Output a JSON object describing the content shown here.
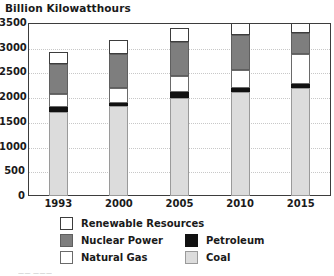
{
  "chart_data": {
    "type": "bar",
    "subtype": "stacked-vertical",
    "title": "Billion Kilowatthours",
    "xlabel": "",
    "ylabel": "Billion Kilowatthours",
    "ylim": [
      0,
      3500
    ],
    "ytick_step": 500,
    "yticks": [
      "0",
      "500",
      "1000",
      "1500",
      "2000",
      "2500",
      "3000",
      "3500"
    ],
    "grid": true,
    "grid_axis": "y",
    "legend_position": "bottom",
    "categories": [
      "1993",
      "2000",
      "2005",
      "2010",
      "2015"
    ],
    "series": [
      {
        "name": "Coal",
        "key": "coal",
        "color": "#dcdcdc",
        "values": [
          1700,
          1830,
          1990,
          2100,
          2180
        ]
      },
      {
        "name": "Petroleum",
        "key": "petroleum",
        "color": "#111111",
        "values": [
          100,
          60,
          110,
          80,
          80
        ]
      },
      {
        "name": "Natural Gas",
        "key": "natural_gas",
        "color": "#ffffff",
        "values": [
          260,
          290,
          330,
          370,
          620
        ]
      },
      {
        "name": "Nuclear Power",
        "key": "nuclear",
        "color": "#7e7e7e",
        "values": [
          610,
          700,
          680,
          700,
          420
        ]
      },
      {
        "name": "Renewable Resources",
        "key": "renewable",
        "color": "#ffffff",
        "values": [
          250,
          280,
          280,
          260,
          210
        ]
      }
    ],
    "totals": [
      2920,
      3160,
      3390,
      3510,
      3510
    ],
    "legend_entries": [
      {
        "label": "Renewable Resources",
        "key": "renewable",
        "column": 0,
        "row": 0
      },
      {
        "label": "Nuclear Power",
        "key": "nuclear",
        "column": 0,
        "row": 1
      },
      {
        "label": "Natural Gas",
        "key": "natural_gas",
        "column": 0,
        "row": 2
      },
      {
        "label": "Petroleum",
        "key": "petroleum",
        "column": 1,
        "row": 1
      },
      {
        "label": "Coal",
        "key": "coal",
        "column": 1,
        "row": 2
      }
    ]
  },
  "footer": {
    "note": "——  ———"
  }
}
